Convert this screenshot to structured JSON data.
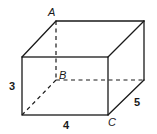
{
  "diagram": {
    "type": "rectangular-prism",
    "vertex_labels": {
      "A": "A",
      "B": "B",
      "C": "C"
    },
    "dimension_labels": {
      "height": "3",
      "length": "4",
      "depth": "5"
    },
    "colors": {
      "stroke": "#1a1a1a",
      "background": "#ffffff"
    }
  }
}
